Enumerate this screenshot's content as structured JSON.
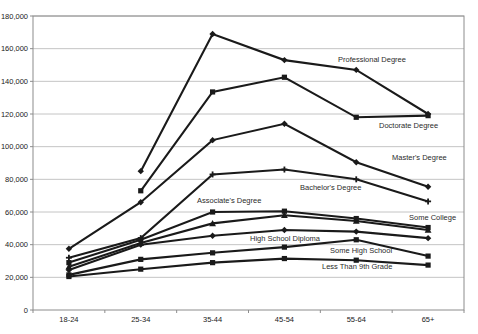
{
  "chart_data": {
    "type": "line",
    "title": "",
    "xlabel": "",
    "ylabel": "",
    "ylim": [
      0,
      180000
    ],
    "ytick_step": 20000,
    "grid": true,
    "legend_position": "inline-annotations",
    "categories": [
      "18-24",
      "25-34",
      "35-44",
      "45-54",
      "55-64",
      "65+"
    ],
    "series": [
      {
        "name": "Professional Degree",
        "marker": "diamond",
        "values": [
          null,
          85000,
          169000,
          153000,
          147000,
          120000
        ]
      },
      {
        "name": "Doctorate Degree",
        "marker": "square",
        "values": [
          null,
          73000,
          133500,
          142500,
          118000,
          119000
        ]
      },
      {
        "name": "Master's Degree",
        "marker": "diamond",
        "values": [
          37500,
          66000,
          104000,
          114000,
          90500,
          75500
        ]
      },
      {
        "name": "Bachelor's Degree",
        "marker": "plus",
        "values": [
          32000,
          44000,
          83000,
          86000,
          80000,
          66500
        ]
      },
      {
        "name": "Associate's Degree",
        "marker": "square",
        "values": [
          29000,
          43000,
          60000,
          60500,
          56000,
          50500
        ]
      },
      {
        "name": "Some College",
        "marker": "triangle",
        "values": [
          26500,
          41000,
          53000,
          58000,
          54500,
          49000
        ]
      },
      {
        "name": "High School Diploma",
        "marker": "diamond",
        "values": [
          24500,
          40000,
          45500,
          49000,
          48000,
          44000
        ]
      },
      {
        "name": "Some High School",
        "marker": "square",
        "values": [
          21500,
          31000,
          35000,
          38500,
          43000,
          33000
        ]
      },
      {
        "name": "Less Than 9th Grade",
        "marker": "square",
        "values": [
          20500,
          25000,
          29000,
          31500,
          30500,
          27500
        ]
      }
    ],
    "annotations": [
      {
        "text": "Professional Degree",
        "x": 338,
        "y": 62
      },
      {
        "text": "Doctorate Degree",
        "x": 379,
        "y": 128
      },
      {
        "text": "Master's Degree",
        "x": 392,
        "y": 160
      },
      {
        "text": "Bachelor's Degree",
        "x": 300,
        "y": 190
      },
      {
        "text": "Associate's Degree",
        "x": 197,
        "y": 203
      },
      {
        "text": "Some College",
        "x": 409,
        "y": 220
      },
      {
        "text": "High School Diploma",
        "x": 250,
        "y": 241
      },
      {
        "text": "Some High School",
        "x": 330,
        "y": 253
      },
      {
        "text": "Less Than 9th Grade",
        "x": 322,
        "y": 269
      }
    ],
    "colors": {
      "line": "#1a1a1a",
      "gridline": "#c4c4c4",
      "axis": "#8c8c8c",
      "background": "#ffffff"
    }
  }
}
